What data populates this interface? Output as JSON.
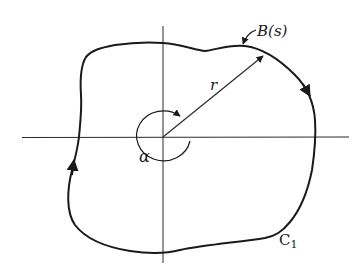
{
  "figure": {
    "labels": {
      "boundary": "B(s)",
      "radius": "r",
      "angle": "α",
      "contour": "C",
      "contour_subscript": "1"
    },
    "colors": {
      "stroke": "#1a1a1a",
      "background": "#ffffff"
    }
  }
}
